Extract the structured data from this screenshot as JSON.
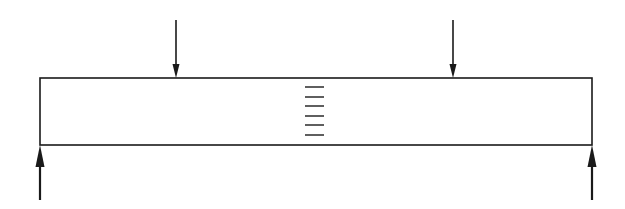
{
  "diagram": {
    "type": "four-point-bending-beam",
    "colors": {
      "background": "#ffffff",
      "stroke": "#1a1a1a"
    },
    "beam": {
      "x": 40,
      "y": 78,
      "width": 552,
      "height": 67
    },
    "loads": [
      {
        "name": "load-arrow-left",
        "x": 176,
        "y_start": 20,
        "y_end": 78,
        "direction": "down"
      },
      {
        "name": "load-arrow-right",
        "x": 453,
        "y_start": 20,
        "y_end": 78,
        "direction": "down"
      }
    ],
    "supports": [
      {
        "name": "reaction-arrow-left",
        "x": 40,
        "y_start": 200,
        "y_end": 145,
        "direction": "up"
      },
      {
        "name": "reaction-arrow-right",
        "x": 592,
        "y_start": 200,
        "y_end": 145,
        "direction": "up"
      }
    ],
    "midspan_marks": {
      "x_start": 305,
      "x_end": 324,
      "y_positions": [
        87,
        97,
        106,
        116,
        125,
        135
      ]
    }
  }
}
